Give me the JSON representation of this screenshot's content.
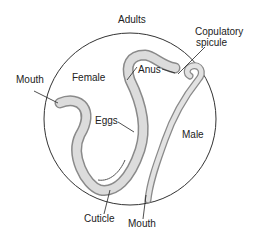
{
  "diagram": {
    "title": "Adults",
    "labels": {
      "copulatory_spicule_1": "Copulatory",
      "copulatory_spicule_2": "spicule",
      "anus": "Anus",
      "mouth_female": "Mouth",
      "female": "Female",
      "eggs": "Eggs",
      "male": "Male",
      "cuticle": "Cuticle",
      "mouth_male": "Mouth"
    },
    "colors": {
      "worm_fill": "#d9d9d9",
      "worm_edge": "#8a8a8a",
      "circle": "#333333"
    }
  }
}
